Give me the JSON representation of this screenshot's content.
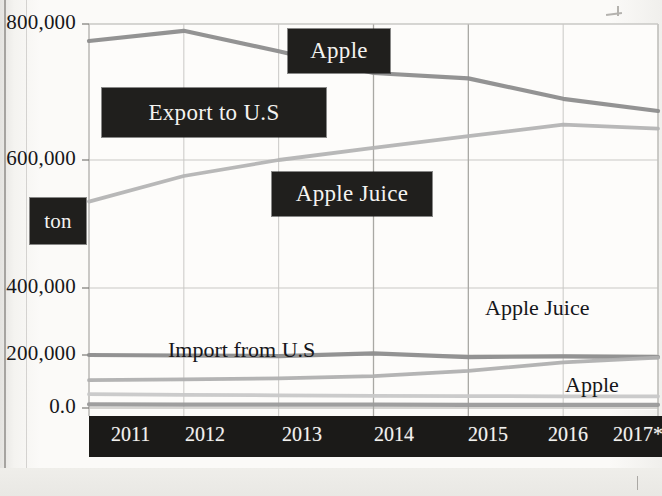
{
  "chart_data": {
    "type": "line",
    "title": "",
    "xlabel": "",
    "ylabel": "ton",
    "categories": [
      "2011",
      "2012",
      "2013",
      "2014",
      "2015",
      "2016",
      "2017*"
    ],
    "ylim": [
      0,
      800000
    ],
    "yticks": [
      0,
      200000,
      400000,
      600000,
      800000
    ],
    "ytick_labels": [
      "0.0",
      "200,000",
      "400,000",
      "600,000",
      "800,000"
    ],
    "grid": true,
    "legend": "inline-annotations",
    "series": [
      {
        "name": "Apple",
        "label_style": "blacked-out",
        "color": "#8d8d8d",
        "values": [
          775000,
          790000,
          760000,
          728000,
          720000,
          690000,
          672000
        ]
      },
      {
        "name": "Apple Juice",
        "label_style": "blacked-out",
        "color": "#b4b4b4",
        "values": [
          535000,
          575000,
          600000,
          618000,
          635000,
          652000,
          646000
        ]
      },
      {
        "name": "Import from U.S",
        "label_style": "plain",
        "color": "#8d8d8d",
        "values": [
          200000,
          198000,
          196000,
          205000,
          192000,
          195000,
          192000
        ]
      },
      {
        "name": "Apple Juice (import)",
        "label_style": "plain",
        "color": "#b0b0b0",
        "values": [
          105000,
          108000,
          112000,
          120000,
          140000,
          172000,
          190000
        ]
      },
      {
        "name": "Apple (import)",
        "label_style": "plain",
        "color": "#c8c8c8",
        "values": [
          52000,
          50000,
          48000,
          46000,
          45000,
          44000,
          44000
        ]
      },
      {
        "name": "baseline",
        "label_style": "none",
        "color": "#9a9a9a",
        "values": [
          14000,
          13000,
          13000,
          13000,
          12000,
          12000,
          12000
        ]
      }
    ]
  },
  "y_axis": {
    "ticks": [
      {
        "label": "800,000",
        "y": 24
      },
      {
        "label": "600,000",
        "y": 160
      },
      {
        "label": "400,000",
        "y": 288
      },
      {
        "label": "200,000",
        "y": 355
      },
      {
        "label": "0.0",
        "y": 408
      }
    ]
  },
  "x_axis": {
    "ticks": [
      {
        "label": "2011",
        "x": 22
      },
      {
        "label": "2012",
        "x": 96
      },
      {
        "label": "2013",
        "x": 193
      },
      {
        "label": "2014",
        "x": 285
      },
      {
        "label": "2015",
        "x": 379
      },
      {
        "label": "2016",
        "x": 459
      },
      {
        "label": "2017*",
        "x": 524
      }
    ]
  },
  "annotations": {
    "redacted": [
      {
        "name": "apple-export",
        "text": "Apple",
        "x": 288,
        "y": 29,
        "w": 102,
        "h": 44
      },
      {
        "name": "export-to-us",
        "text": "Export to U.S",
        "x": 102,
        "y": 88,
        "w": 224,
        "h": 49
      },
      {
        "name": "apple-juice-export",
        "text": "Apple Juice",
        "x": 272,
        "y": 172,
        "w": 160,
        "h": 44
      },
      {
        "name": "ton-unit",
        "text": "ton",
        "x": 30,
        "y": 198,
        "w": 56,
        "h": 46
      }
    ],
    "plain": [
      {
        "name": "import-from-us",
        "text": "Import from U.S",
        "x": 168,
        "y": 337
      },
      {
        "name": "apple-juice-import",
        "text": "Apple Juice",
        "x": 485,
        "y": 295
      },
      {
        "name": "apple-import",
        "text": "Apple",
        "x": 565,
        "y": 372
      }
    ]
  },
  "colors": {
    "page_background": "#f8f7f4",
    "redaction_box": "#201f1d",
    "axis_text": "#17171a",
    "gridline": "#c9c8c5",
    "series_dark": "#8d8d8d",
    "series_mid": "#b4b4b4",
    "series_light": "#c8c8c8"
  }
}
